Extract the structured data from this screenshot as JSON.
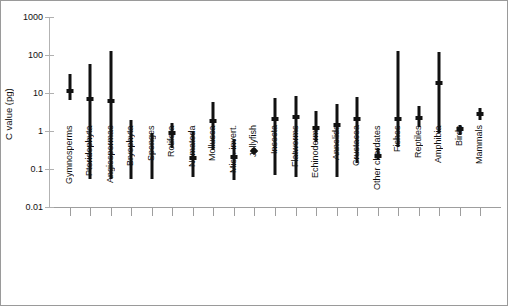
{
  "figure": {
    "background": "#ffffff",
    "border_color": "#9a9a9a",
    "mark_color": "#111111",
    "axis_color": "#9e9e9e"
  },
  "chart_data": {
    "type": "scatter",
    "title": "",
    "subtitle": "",
    "xlabel": "",
    "ylabel": "C value (pg)",
    "yscale": "log",
    "ylim": [
      0.01,
      1000
    ],
    "ytick_labels": [
      "1000",
      "100",
      "10",
      "1",
      "0.1",
      "0.01"
    ],
    "ytick_values": [
      1000,
      100,
      10,
      1,
      0.1,
      0.01
    ],
    "grid": false,
    "legend": "none",
    "marker": "diamond mean with vertical min-max range bar",
    "categories": [
      "Gymnosperms",
      "Pteridophyta",
      "Angiospermae",
      "Bryophyta",
      "Sponges",
      "Rotifera",
      "Nematoda",
      "Mollusca",
      "Misc. invert.",
      "Jellyfish",
      "Insecta",
      "Flatworms",
      "Echinoderms",
      "Annelida",
      "Crustacea",
      "Other chordates",
      "Fishes",
      "Reptiles",
      "Amphibia",
      "Birds",
      "Mammals"
    ],
    "series": [
      {
        "name": "C value range and mean",
        "points": [
          {
            "category": "Gymnosperms",
            "min": 6.5,
            "max": 32,
            "mean": 11
          },
          {
            "category": "Pteridophyta",
            "min": 0.055,
            "max": 57,
            "mean": 7.0
          },
          {
            "category": "Angiospermae",
            "min": 0.055,
            "max": 130,
            "mean": 6.2
          },
          {
            "category": "Bryophyta",
            "min": 0.055,
            "max": 2.0,
            "mean": null
          },
          {
            "category": "Sponges",
            "min": 0.055,
            "max": 0.9,
            "mean": null
          },
          {
            "category": "Rotifera",
            "min": 0.36,
            "max": 1.6,
            "mean": 0.9
          },
          {
            "category": "Nematoda",
            "min": 0.06,
            "max": 0.95,
            "mean": 0.2
          },
          {
            "category": "Mollusca",
            "min": 0.31,
            "max": 5.9,
            "mean": 1.8
          },
          {
            "category": "Misc. invert.",
            "min": 0.05,
            "max": 0.62,
            "mean": 0.21
          },
          {
            "category": "Jellyfish",
            "min": null,
            "max": null,
            "mean": 0.3
          },
          {
            "category": "Insecta",
            "min": 0.07,
            "max": 7.5,
            "mean": 2.1
          },
          {
            "category": "Flatworms",
            "min": 0.06,
            "max": 8.5,
            "mean": 2.4
          },
          {
            "category": "Echinoderms",
            "min": 0.52,
            "max": 3.3,
            "mean": 1.2
          },
          {
            "category": "Annelida",
            "min": 0.06,
            "max": 5.0,
            "mean": 1.4
          },
          {
            "category": "Crustacea",
            "min": 0.14,
            "max": 8.0,
            "mean": 2.1
          },
          {
            "category": "Other chordates",
            "min": 0.17,
            "max": 0.35,
            "mean": 0.22
          },
          {
            "category": "Fishes",
            "min": 0.38,
            "max": 130,
            "mean": 2.1
          },
          {
            "category": "Reptiles",
            "min": 1.3,
            "max": 4.5,
            "mean": 2.2
          },
          {
            "category": "Amphibia",
            "min": 0.9,
            "max": 120,
            "mean": 18
          },
          {
            "category": "Birds",
            "min": 0.8,
            "max": 1.4,
            "mean": 1.1
          },
          {
            "category": "Mammals",
            "min": 1.9,
            "max": 4.0,
            "mean": 2.8
          }
        ]
      }
    ]
  }
}
